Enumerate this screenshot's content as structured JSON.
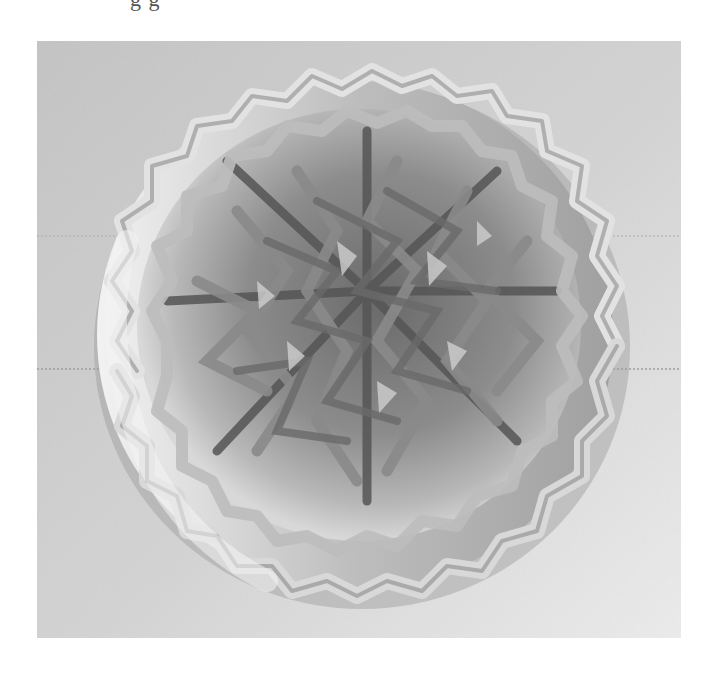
{
  "page": {
    "caption_fragment": "g        g"
  },
  "photo": {
    "subject": "Round woven lattice basket viewed from above",
    "description": "Grayscale photograph of a circular openwork basket made of zig-zag struts forming a star-like lattice, on a light gray textured surface",
    "colors": {
      "background_left": "#bdbdbd",
      "background_right": "#e6e6e6",
      "strut_light": "#ececec",
      "strut_mid": "#9a9a9a",
      "strut_dark": "#4a4a4a",
      "interior_shadow": "#5c5c5c"
    },
    "frame": {
      "x": 37,
      "y": 41,
      "width": 644,
      "height": 597
    },
    "basket": {
      "cx": 355,
      "cy": 335,
      "rx": 262,
      "ry": 258
    }
  }
}
